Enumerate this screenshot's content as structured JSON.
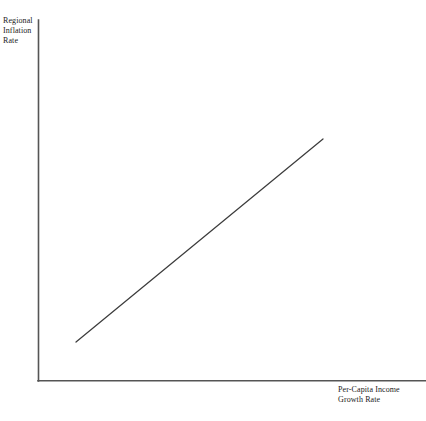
{
  "chart_data": {
    "type": "line",
    "title": "",
    "subtitle": "",
    "xlabel_lines": [
      "Per-Capita Income",
      "Growth Rate"
    ],
    "ylabel_lines": [
      "Regional",
      "Inflation",
      "Rate"
    ],
    "xlabel": "Per-Capita Income Growth Rate",
    "ylabel": "Regional Inflation Rate",
    "grid": false,
    "legend": false,
    "legend_position": "none",
    "tick_labels_x": [],
    "tick_labels_y": [],
    "xlim": [
      0,
      1
    ],
    "ylim": [
      0,
      1
    ],
    "series": [
      {
        "name": "Positive relationship",
        "x": [
          0.155,
          0.735
        ],
        "y": [
          0.108,
          0.669
        ],
        "annotation": "upward-sloping straight line"
      }
    ],
    "axis_color": "#555555",
    "line_color": "#3c3c3c",
    "background_color": "#ffffff"
  },
  "geometry": {
    "origin_x": 38,
    "origin_y": 381,
    "y_axis_top": 20,
    "x_axis_right": 426,
    "line_x1": 76,
    "line_y1": 342,
    "line_x2": 323,
    "line_y2": 139
  }
}
